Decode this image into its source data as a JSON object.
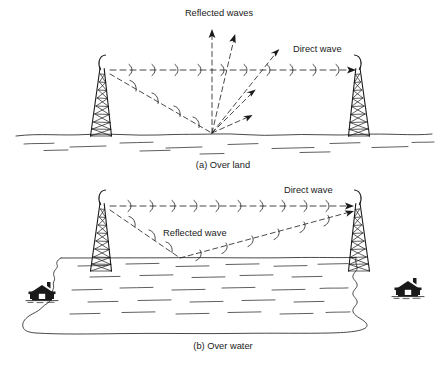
{
  "figure": {
    "ink_color": "#1a1a1a",
    "background_color": "#ffffff"
  },
  "panel_a": {
    "caption": "(a)  Over land",
    "labels": {
      "reflected": "Reflected waves",
      "direct": "Direct wave"
    },
    "elements": {
      "transmit_tower": "lattice-tower-left",
      "receive_tower": "lattice-tower-right",
      "ground": "ground-line",
      "bounce_point": "reflection-point"
    },
    "reflected_arrow_count": 5
  },
  "panel_b": {
    "caption": "(b)  Over water",
    "labels": {
      "reflected": "Reflected wave",
      "direct": "Direct wave"
    },
    "elements": {
      "transmit_tower": "lattice-tower-left",
      "receive_tower": "lattice-tower-right",
      "water": "water-body",
      "shoreline": "shoreline",
      "house_left": "house-icon",
      "house_right": "house-icon"
    },
    "house_count": 2
  }
}
